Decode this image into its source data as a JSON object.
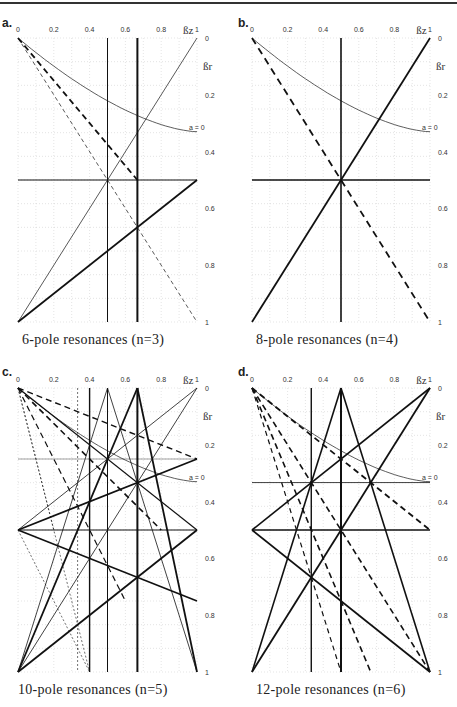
{
  "panels": [
    {
      "id": "a",
      "label": "a.",
      "caption": "6-pole resonances (n=3)",
      "box": {
        "x": 18,
        "y": 38,
        "w": 179,
        "h": 284
      },
      "labelPos": {
        "x": 2,
        "y": 16
      },
      "captionPos": {
        "x": 22,
        "y": 332
      },
      "curve": true,
      "curveLabel": "a = 0",
      "lines": [
        {
          "p": [
            [
              0,
              0
            ],
            [
              0.667,
              0.5
            ]
          ],
          "w": 1.8,
          "d": "6,4"
        },
        {
          "p": [
            [
              0,
              0
            ],
            [
              1,
              1
            ]
          ],
          "w": 0.7,
          "d": "4,3"
        },
        {
          "p": [
            [
              0.5,
              0
            ],
            [
              0.5,
              1
            ]
          ],
          "w": 1
        },
        {
          "p": [
            [
              0.667,
              0
            ],
            [
              0.667,
              1
            ]
          ],
          "w": 2
        },
        {
          "p": [
            [
              0,
              0.5
            ],
            [
              1,
              0.5
            ]
          ],
          "w": 1
        },
        {
          "p": [
            [
              1,
              0
            ],
            [
              0,
              1
            ]
          ],
          "w": 0.7
        },
        {
          "p": [
            [
              1,
              0.5
            ],
            [
              0,
              1
            ]
          ],
          "w": 1.8
        }
      ]
    },
    {
      "id": "b",
      "label": "b.",
      "caption": "8-pole resonances (n=4)",
      "box": {
        "x": 252,
        "y": 38,
        "w": 178,
        "h": 284
      },
      "labelPos": {
        "x": 238,
        "y": 16
      },
      "captionPos": {
        "x": 256,
        "y": 332
      },
      "curve": true,
      "curveLabel": "a = 0",
      "lines": [
        {
          "p": [
            [
              0,
              0
            ],
            [
              1,
              1
            ]
          ],
          "w": 1.8,
          "d": "7,5"
        },
        {
          "p": [
            [
              0.5,
              0
            ],
            [
              0.5,
              1
            ]
          ],
          "w": 1.6
        },
        {
          "p": [
            [
              0,
              0.5
            ],
            [
              1,
              0.5
            ]
          ],
          "w": 1.6
        },
        {
          "p": [
            [
              1,
              0
            ],
            [
              0,
              1
            ]
          ],
          "w": 1.8
        }
      ]
    },
    {
      "id": "c",
      "label": "c.",
      "caption": "10-pole resonances (n=5)",
      "box": {
        "x": 18,
        "y": 388,
        "w": 179,
        "h": 284
      },
      "labelPos": {
        "x": 2,
        "y": 365
      },
      "captionPos": {
        "x": 18,
        "y": 682
      },
      "curve": true,
      "curveLabel": "a = 0",
      "lines": [
        {
          "p": [
            [
              0,
              0
            ],
            [
              1,
              0.25
            ]
          ],
          "w": 1.4,
          "d": "6,4"
        },
        {
          "p": [
            [
              0,
              0
            ],
            [
              0.8,
              0.5
            ]
          ],
          "w": 1.6,
          "d": "6,4"
        },
        {
          "p": [
            [
              0,
              0
            ],
            [
              0.6,
              0.75
            ]
          ],
          "w": 1.2,
          "d": "6,4"
        },
        {
          "p": [
            [
              0,
              0
            ],
            [
              0.4,
              1
            ]
          ],
          "w": 0.6,
          "d": "2,2"
        },
        {
          "p": [
            [
              0,
              0
            ],
            [
              0.2,
              0.5
            ]
          ],
          "w": 0.6,
          "d": "2,2"
        },
        {
          "p": [
            [
              0.333,
              0
            ],
            [
              0.333,
              1
            ]
          ],
          "w": 0.6,
          "d": "2,2"
        },
        {
          "p": [
            [
              0.4,
              0
            ],
            [
              0.4,
              1
            ]
          ],
          "w": 1.4
        },
        {
          "p": [
            [
              0.5,
              0
            ],
            [
              0.5,
              1
            ]
          ],
          "w": 1
        },
        {
          "p": [
            [
              0.667,
              0
            ],
            [
              0.667,
              1
            ]
          ],
          "w": 2
        },
        {
          "p": [
            [
              0,
              0.5
            ],
            [
              1,
              0.5
            ]
          ],
          "w": 1
        },
        {
          "p": [
            [
              0,
              0.25
            ],
            [
              1,
              0.25
            ]
          ],
          "w": 0.4
        },
        {
          "p": [
            [
              0.5,
              0
            ],
            [
              0,
              1
            ]
          ],
          "w": 0.8
        },
        {
          "p": [
            [
              0.5,
              0
            ],
            [
              1,
              1
            ]
          ],
          "w": 0.8
        },
        {
          "p": [
            [
              0.667,
              0
            ],
            [
              0,
              1
            ]
          ],
          "w": 1.8
        },
        {
          "p": [
            [
              0.667,
              0
            ],
            [
              1,
              1
            ]
          ],
          "w": 1.8
        },
        {
          "p": [
            [
              1,
              0
            ],
            [
              0,
              0.5
            ]
          ],
          "w": 0.8
        },
        {
          "p": [
            [
              1,
              0
            ],
            [
              0,
              1
            ]
          ],
          "w": 0.8
        },
        {
          "p": [
            [
              1,
              0.25
            ],
            [
              0,
              0.5
            ]
          ],
          "w": 1.8
        },
        {
          "p": [
            [
              0,
              0.5
            ],
            [
              1,
              0.75
            ]
          ],
          "w": 1.6
        },
        {
          "p": [
            [
              0,
              0
            ],
            [
              1,
              0.5
            ]
          ],
          "w": 1.2
        },
        {
          "p": [
            [
              0,
              1
            ],
            [
              1,
              0.5
            ]
          ],
          "w": 1.8
        },
        {
          "p": [
            [
              0,
              0.5
            ],
            [
              0.4,
              1
            ]
          ],
          "w": 0.6,
          "d": "2,2"
        }
      ]
    },
    {
      "id": "d",
      "label": "d.",
      "caption": "12-pole resonances (n=6)",
      "box": {
        "x": 252,
        "y": 388,
        "w": 178,
        "h": 284
      },
      "labelPos": {
        "x": 238,
        "y": 365
      },
      "captionPos": {
        "x": 256,
        "y": 682
      },
      "curve": true,
      "curveLabel": "a = 0",
      "lines": [
        {
          "p": [
            [
              0,
              0
            ],
            [
              1,
              1
            ]
          ],
          "w": 1.6,
          "d": "6,4"
        },
        {
          "p": [
            [
              0,
              0
            ],
            [
              0.667,
              1
            ]
          ],
          "w": 1.6,
          "d": "6,4"
        },
        {
          "p": [
            [
              0,
              0
            ],
            [
              0.5,
              1
            ]
          ],
          "w": 1.2,
          "d": "5,4"
        },
        {
          "p": [
            [
              0,
              0
            ],
            [
              1,
              0.5
            ]
          ],
          "w": 1.8,
          "d": "6,4"
        },
        {
          "p": [
            [
              0.333,
              0
            ],
            [
              0.333,
              1
            ]
          ],
          "w": 1.4
        },
        {
          "p": [
            [
              0.5,
              0
            ],
            [
              0.5,
              1
            ]
          ],
          "w": 2
        },
        {
          "p": [
            [
              0,
              0.5
            ],
            [
              1,
              0.5
            ]
          ],
          "w": 1.6
        },
        {
          "p": [
            [
              0,
              0.333
            ],
            [
              1,
              0.333
            ]
          ],
          "w": 0.8
        },
        {
          "p": [
            [
              0.5,
              0
            ],
            [
              0,
              1
            ]
          ],
          "w": 1.6
        },
        {
          "p": [
            [
              0.5,
              0
            ],
            [
              1,
              1
            ]
          ],
          "w": 1.6
        },
        {
          "p": [
            [
              1,
              0
            ],
            [
              0,
              0.5
            ]
          ],
          "w": 1.6
        },
        {
          "p": [
            [
              1,
              0
            ],
            [
              0,
              1
            ]
          ],
          "w": 1.8
        },
        {
          "p": [
            [
              0,
              0.5
            ],
            [
              1,
              1
            ]
          ],
          "w": 1.8
        }
      ]
    }
  ],
  "axes": {
    "x_label": "ßz",
    "y_label": "ßr",
    "x_ticks": [
      "0",
      "0.2",
      "0.4",
      "0.6",
      "0.8",
      "1"
    ],
    "y_ticks": [
      "0",
      "0.2",
      "0.4",
      "0.6",
      "0.8",
      "1"
    ]
  }
}
